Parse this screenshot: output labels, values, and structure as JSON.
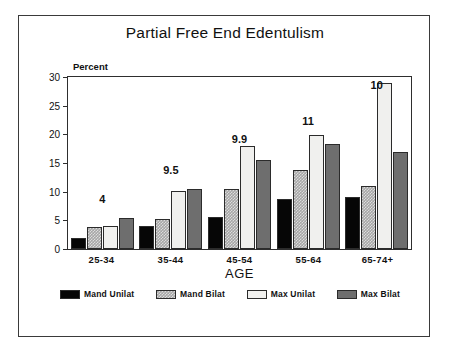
{
  "figure": {
    "background": "#ffffff",
    "frame_color": "#3a3a3a"
  },
  "chart_data": {
    "type": "bar",
    "title": "Partial Free End Edentulism",
    "xlabel": "AGE",
    "ylabel": "Percent",
    "categories": [
      "25-34",
      "35-44",
      "45-54",
      "55-64",
      "65-74+"
    ],
    "series": [
      {
        "name": "Mand Unilat",
        "color": "#060606",
        "values": [
          2.0,
          4.0,
          5.5,
          8.7,
          9.0
        ]
      },
      {
        "name": "Mand Bilat",
        "color": "#a6a6a6",
        "values": [
          3.8,
          5.3,
          10.4,
          13.7,
          11.0
        ]
      },
      {
        "name": "Max Unilat",
        "color": "#f0f0ee",
        "values": [
          4.1,
          10.1,
          18.0,
          19.9,
          29.0
        ]
      },
      {
        "name": "Max Bilat",
        "color": "#6e6e6e",
        "values": [
          5.4,
          10.5,
          15.5,
          18.3,
          17.0
        ]
      }
    ],
    "annotations": [
      "4",
      "9.5",
      "9.9",
      "11",
      "10"
    ],
    "annotation_offsets_px": [
      44,
      73,
      104,
      122,
      158
    ],
    "ylim": [
      0,
      30
    ],
    "yticks": [
      0,
      5,
      10,
      15,
      20,
      25,
      30
    ],
    "grid": false,
    "legend_position": "below"
  }
}
